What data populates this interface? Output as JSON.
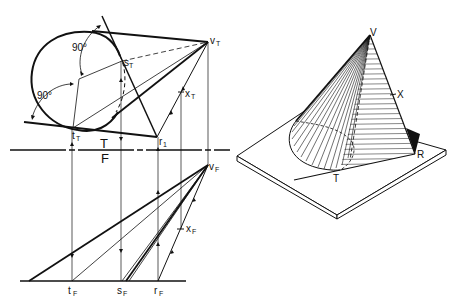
{
  "figure": {
    "left_panel": {
      "description": "Orthographic top (T) and front (F) views of a cone with tangent planes",
      "top_view": {
        "vertex_label": "v",
        "vertex_sub": "T",
        "point_s": "s",
        "point_s_sub": "T",
        "point_t": "t",
        "point_t_sub": "T",
        "point_r": "r",
        "point_r_sub": "1",
        "point_x": "x",
        "point_x_sub": "T",
        "angle_upper": "90°",
        "angle_lower": "90°"
      },
      "fold_line": {
        "upper_label": "T",
        "lower_label": "F"
      },
      "front_view": {
        "vertex_label": "v",
        "vertex_sub": "F",
        "point_x": "x",
        "point_x_sub": "F",
        "point_t": "t",
        "point_t_sub": "F",
        "point_s": "s",
        "point_s_sub": "F",
        "point_r": "r",
        "point_r_sub": "F"
      }
    },
    "right_panel": {
      "description": "Pictorial (isometric) view of cone on plate with tangent plane",
      "vertex_label": "V",
      "point_x_label": "X",
      "point_r_label": "R",
      "point_t_label": "T"
    }
  }
}
